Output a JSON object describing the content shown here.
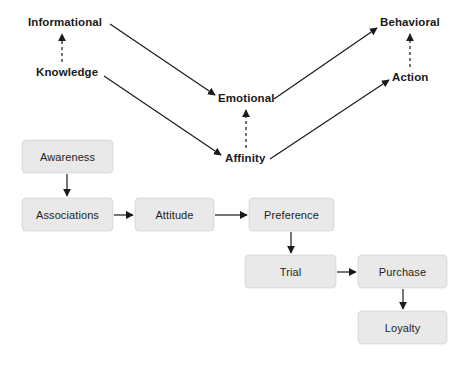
{
  "diagram": {
    "colors": {
      "box_fill": "#e9e9e9",
      "box_border": "#dedede",
      "text": "#231f20",
      "label_text": "#1a1a1a",
      "arrow": "#1a1a1a",
      "background": "#ffffff"
    },
    "upper_labels": [
      {
        "id": "informational",
        "text": "Informational",
        "x": 28,
        "y": 16
      },
      {
        "id": "knowledge",
        "text": "Knowledge",
        "x": 36,
        "y": 66
      },
      {
        "id": "emotional",
        "text": "Emotional",
        "x": 218,
        "y": 92
      },
      {
        "id": "affinity",
        "text": "Affinity",
        "x": 225,
        "y": 152
      },
      {
        "id": "behavioral",
        "text": "Behavioral",
        "x": 380,
        "y": 16
      },
      {
        "id": "action",
        "text": "Action",
        "x": 392,
        "y": 71
      }
    ],
    "boxes": [
      {
        "id": "awareness",
        "text": "Awareness",
        "x": 22,
        "y": 140,
        "w": 91,
        "h": 33
      },
      {
        "id": "associations",
        "text": "Associations",
        "x": 22,
        "y": 198,
        "w": 91,
        "h": 33
      },
      {
        "id": "attitude",
        "text": "Attitude",
        "x": 135,
        "y": 198,
        "w": 79,
        "h": 33
      },
      {
        "id": "preference",
        "text": "Preference",
        "x": 249,
        "y": 198,
        "w": 85,
        "h": 33
      },
      {
        "id": "trial",
        "text": "Trial",
        "x": 245,
        "y": 255,
        "w": 91,
        "h": 33
      },
      {
        "id": "purchase",
        "text": "Purchase",
        "x": 358,
        "y": 255,
        "w": 89,
        "h": 33
      },
      {
        "id": "loyalty",
        "text": "Loyalty",
        "x": 358,
        "y": 311,
        "w": 89,
        "h": 33
      }
    ],
    "edges": [
      {
        "id": "knowledge-to-informational",
        "style": "dashed",
        "from": "knowledge",
        "to": "informational"
      },
      {
        "id": "affinity-to-emotional",
        "style": "dashed",
        "from": "affinity",
        "to": "emotional"
      },
      {
        "id": "action-to-behavioral",
        "style": "dashed",
        "from": "action",
        "to": "behavioral"
      },
      {
        "id": "informational-to-emotional",
        "style": "solid",
        "from": "informational",
        "to": "emotional"
      },
      {
        "id": "knowledge-to-affinity",
        "style": "solid",
        "from": "knowledge",
        "to": "affinity"
      },
      {
        "id": "emotional-to-behavioral",
        "style": "solid",
        "from": "emotional",
        "to": "behavioral"
      },
      {
        "id": "affinity-to-action",
        "style": "solid",
        "from": "affinity",
        "to": "action"
      },
      {
        "id": "awareness-to-associations",
        "style": "solid",
        "from": "awareness",
        "to": "associations"
      },
      {
        "id": "associations-to-attitude",
        "style": "solid",
        "from": "associations",
        "to": "attitude"
      },
      {
        "id": "attitude-to-preference",
        "style": "solid",
        "from": "attitude",
        "to": "preference"
      },
      {
        "id": "preference-to-trial",
        "style": "solid",
        "from": "preference",
        "to": "trial"
      },
      {
        "id": "trial-to-purchase",
        "style": "solid",
        "from": "trial",
        "to": "purchase"
      },
      {
        "id": "purchase-to-loyalty",
        "style": "solid",
        "from": "purchase",
        "to": "loyalty"
      }
    ]
  }
}
